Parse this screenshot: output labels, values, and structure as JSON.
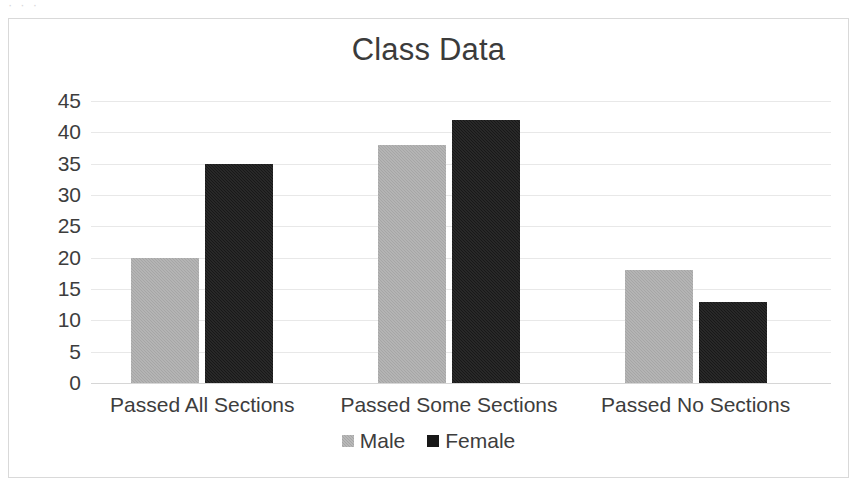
{
  "top_remnant_text": "· · ·",
  "frame": {
    "border_color": "#d9d9d9",
    "background": "#ffffff"
  },
  "chart_data": {
    "type": "bar",
    "title": "Class Data",
    "xlabel": "",
    "ylabel": "",
    "categories": [
      "Passed All Sections",
      "Passed Some Sections",
      "Passed No Sections"
    ],
    "series": [
      {
        "name": "Male",
        "color": "#a6a6a6",
        "values": [
          20,
          38,
          18
        ]
      },
      {
        "name": "Female",
        "color": "#181818",
        "values": [
          35,
          42,
          13
        ]
      }
    ],
    "ylim": [
      0,
      45
    ],
    "ytick_step": 5,
    "yticks": [
      0,
      5,
      10,
      15,
      20,
      25,
      30,
      35,
      40,
      45
    ],
    "ytick_labels": [
      "0",
      "5",
      "10",
      "15",
      "20",
      "25",
      "30",
      "35",
      "40",
      "45"
    ],
    "grid": true,
    "grid_axis": "y",
    "legend": true,
    "legend_position": "bottom",
    "legend_entries": [
      "Male",
      "Female"
    ]
  }
}
